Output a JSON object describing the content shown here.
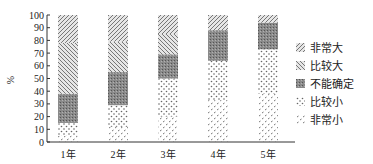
{
  "chart_data": {
    "type": "bar",
    "stacked": true,
    "title": "",
    "xlabel": "",
    "ylabel": "%",
    "ylim": [
      0,
      100
    ],
    "yticks": [
      0,
      10,
      20,
      30,
      40,
      50,
      60,
      70,
      80,
      90,
      100
    ],
    "categories": [
      "1年",
      "2年",
      "3年",
      "4年",
      "5年"
    ],
    "series": [
      {
        "name": "非常小",
        "values": [
          5,
          12,
          20,
          33,
          38
        ]
      },
      {
        "name": "比较小",
        "values": [
          10,
          17,
          30,
          31,
          35
        ]
      },
      {
        "name": "不能确定",
        "values": [
          23,
          26,
          19,
          24,
          21
        ]
      },
      {
        "name": "比较大",
        "values": [
          40,
          24,
          16,
          0,
          0
        ]
      },
      {
        "name": "非常大",
        "values": [
          22,
          21,
          15,
          12,
          6
        ]
      }
    ],
    "legend_position": "right",
    "legend_order": [
      "非常大",
      "比较大",
      "不能确定",
      "比较小",
      "非常小"
    ],
    "grid": false
  },
  "legend": {
    "items": [
      {
        "label": "非常大",
        "pattern": "hatch-a"
      },
      {
        "label": "比较大",
        "pattern": "hatch-b"
      },
      {
        "label": "不能确定",
        "pattern": "dark"
      },
      {
        "label": "比较小",
        "pattern": "dots"
      },
      {
        "label": "非常小",
        "pattern": "ticks"
      }
    ]
  }
}
